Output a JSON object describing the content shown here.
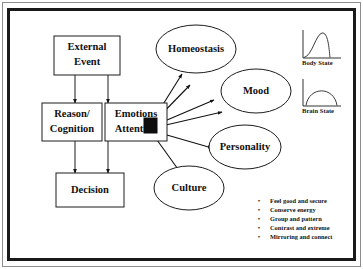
{
  "diagram": {
    "boxes": [
      {
        "id": "external_event",
        "label_line1": "External",
        "label_line2": "Event"
      },
      {
        "id": "reason_cognition",
        "label_line1": "Reason/",
        "label_line2": "Cognition"
      },
      {
        "id": "emotions_attention",
        "label_line1": "Emotions",
        "label_line2": "Attention"
      },
      {
        "id": "decision",
        "label_line1": "Decision",
        "label_line2": ""
      }
    ],
    "ellipses": [
      {
        "id": "homeostasis",
        "label": "Homeostasis"
      },
      {
        "id": "mood",
        "label": "Mood"
      },
      {
        "id": "personality",
        "label": "Personality"
      },
      {
        "id": "culture",
        "label": "Culture"
      }
    ],
    "hub": {
      "id": "attention-hub",
      "shape": "filled-square"
    },
    "mini_charts": [
      {
        "id": "body_state",
        "caption": "Body State",
        "curve": "right-skewed-peak"
      },
      {
        "id": "brain_state",
        "caption": "Brain State",
        "curve": "symmetric-dome"
      }
    ],
    "bullets": [
      "Feel good and secure",
      "Conserve energy",
      "Group and pattern",
      "Contrast and extreme",
      "Mirroring and connect"
    ],
    "bullet_marker": "•"
  },
  "colors": {
    "ink": "#1c1c1c",
    "hub": "#0d0d0d",
    "frame_thick": "#1a1a1a",
    "frame_thin": "#8d8d8d",
    "background": "#ffffff"
  }
}
